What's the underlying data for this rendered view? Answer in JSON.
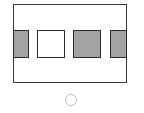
{
  "diagram": {
    "frame": {
      "x": 13,
      "y": 4,
      "width": 114,
      "height": 79,
      "stroke": "#3a3a3a"
    },
    "cells": [
      {
        "name": "left-partial-gray",
        "x": 13,
        "y": 30,
        "width": 16,
        "height": 28,
        "fill": "#a3a3a3"
      },
      {
        "name": "white-square",
        "x": 37,
        "y": 30,
        "width": 28,
        "height": 28,
        "fill": "#ffffff"
      },
      {
        "name": "gray-square",
        "x": 73,
        "y": 30,
        "width": 28,
        "height": 28,
        "fill": "#a3a3a3"
      },
      {
        "name": "right-partial-gray",
        "x": 110,
        "y": 30,
        "width": 17,
        "height": 28,
        "fill": "#a3a3a3"
      }
    ],
    "option_circle": {
      "cx": 71,
      "cy": 100,
      "r": 6,
      "stroke": "#bdbdbd",
      "selected": false
    }
  }
}
